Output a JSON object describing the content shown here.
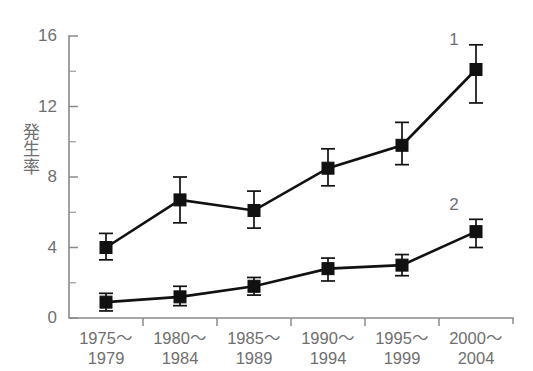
{
  "chart_data": {
    "type": "line",
    "title": "",
    "subtitle": "",
    "xlabel": "",
    "ylabel": "発生率",
    "ylabel_chars": [
      "発",
      "生",
      "率"
    ],
    "categories": [
      "1975〜\n1979",
      "1980〜\n1984",
      "1985〜\n1989",
      "1990〜\n1994",
      "1995〜\n1999",
      "2000〜\n2004"
    ],
    "category_lines": [
      [
        "1975〜",
        "1979"
      ],
      [
        "1980〜",
        "1984"
      ],
      [
        "1985〜",
        "1989"
      ],
      [
        "1990〜",
        "1994"
      ],
      [
        "1995〜",
        "1999"
      ],
      [
        "2000〜",
        "2004"
      ]
    ],
    "ylim": [
      0,
      16
    ],
    "yticks_major": [
      0,
      4,
      8,
      12,
      16
    ],
    "yticks_minor": [
      2,
      6,
      10,
      14
    ],
    "ytick_labels": [
      "0",
      "4",
      "8",
      "12",
      "16"
    ],
    "grid": false,
    "legend_position": "inline-right",
    "error_bars": true,
    "series": [
      {
        "name": "1",
        "label": "1",
        "color": "#111111",
        "marker": "square",
        "values": [
          4.0,
          6.7,
          6.1,
          8.5,
          9.8,
          14.1
        ],
        "err_low": [
          3.3,
          5.4,
          5.1,
          7.5,
          8.7,
          12.2
        ],
        "err_high": [
          4.8,
          8.0,
          7.2,
          9.6,
          11.1,
          15.5
        ]
      },
      {
        "name": "2",
        "label": "2",
        "color": "#111111",
        "marker": "square",
        "values": [
          0.9,
          1.2,
          1.8,
          2.8,
          3.0,
          4.9
        ],
        "err_low": [
          0.4,
          0.7,
          1.3,
          2.1,
          2.4,
          4.0
        ],
        "err_high": [
          1.4,
          1.8,
          2.3,
          3.4,
          3.6,
          5.6
        ]
      }
    ],
    "annotations": [
      {
        "text": "1",
        "series": "1",
        "x_value": 6,
        "y_value": 15.5
      },
      {
        "text": "2",
        "series": "2",
        "x_value": 6,
        "y_value": 6.1
      }
    ],
    "colors": {
      "background": "#ffffff",
      "axis": "#8a8a8a",
      "text": "#6f6f6f",
      "data": "#111111"
    }
  }
}
